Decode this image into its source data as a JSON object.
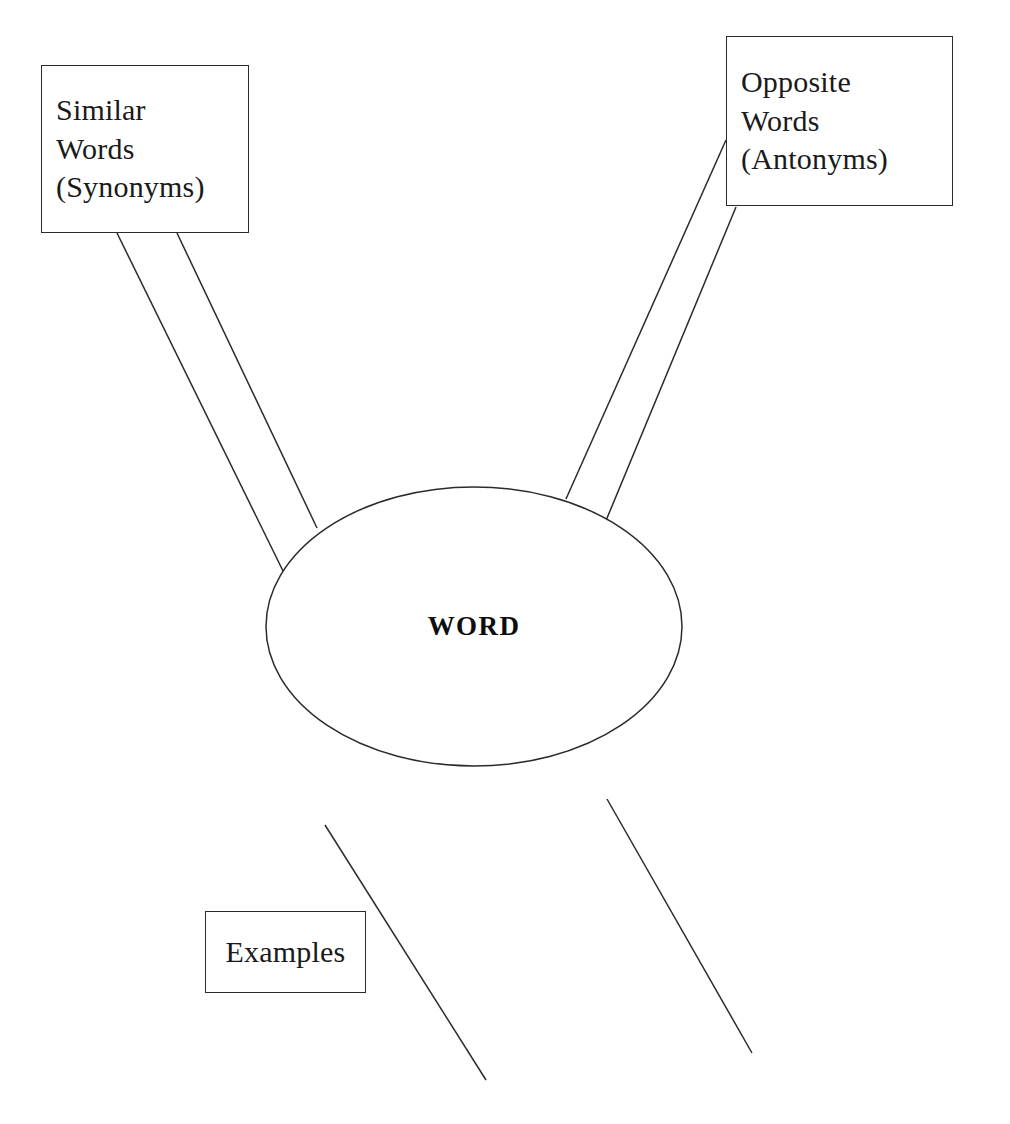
{
  "diagram": {
    "type": "word-map-graphic-organizer",
    "center": {
      "id": "center-word",
      "shape": "ellipse",
      "label": "WORD"
    },
    "nodes": [
      {
        "id": "similar-words",
        "shape": "rectangle",
        "label": "Similar\nWords\n(Synonyms)",
        "position": "top-left"
      },
      {
        "id": "opposite-words",
        "shape": "rectangle",
        "label": "Opposite\nWords\n(Antonyms)",
        "position": "top-right"
      },
      {
        "id": "examples",
        "shape": "rectangle",
        "label": "Examples",
        "position": "bottom-left"
      }
    ],
    "connectors": [
      {
        "id": "connector-similar-left",
        "from": "similar-words",
        "to": "center-word",
        "x1": 117,
        "y1": 233,
        "x2": 285,
        "y2": 575
      },
      {
        "id": "connector-similar-right",
        "from": "similar-words",
        "to": "center-word",
        "x1": 177,
        "y1": 233,
        "x2": 317,
        "y2": 528
      },
      {
        "id": "connector-opposite-left",
        "from": "opposite-words",
        "to": "center-word",
        "x1": 726,
        "y1": 140,
        "x2": 566,
        "y2": 499
      },
      {
        "id": "connector-opposite-right",
        "from": "opposite-words",
        "to": "center-word",
        "x1": 736,
        "y1": 207,
        "x2": 605,
        "y2": 523
      },
      {
        "id": "connector-bottom-left",
        "from": "center-word",
        "to": "lower-left",
        "x1": 325,
        "y1": 825,
        "x2": 486,
        "y2": 1080
      },
      {
        "id": "connector-bottom-right",
        "from": "center-word",
        "to": "lower-right",
        "x1": 607,
        "y1": 799,
        "x2": 752,
        "y2": 1053
      }
    ],
    "colors": {
      "background": "#ffffff",
      "stroke": "#2b2b2b",
      "text": "#1a1a1a"
    }
  }
}
